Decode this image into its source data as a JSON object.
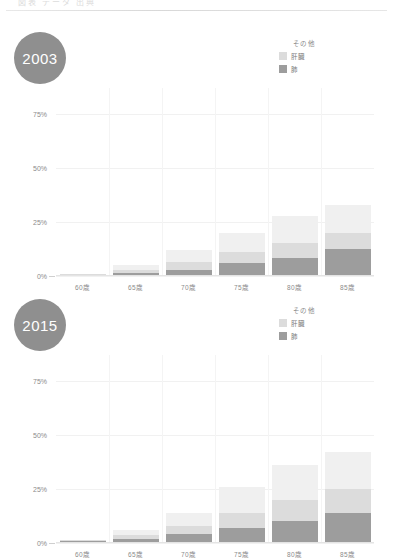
{
  "page": {
    "header_ghost": "図表  データ  出典",
    "background": "#ffffff"
  },
  "colors": {
    "series_lung": "#9d9d9d",
    "series_liver": "#dcdcdc",
    "series_other": "#f0f0f0",
    "badge": "#8f8f8f",
    "badge_text": "#ffffff",
    "axis_text": "#8b8b8b",
    "gridline": "#f1f1f1"
  },
  "charts": [
    {
      "id": "chart-2003",
      "year_badge": "2003",
      "legend": {
        "title": "その他",
        "items": [
          {
            "label": "肝臓",
            "color": "#dcdcdc"
          },
          {
            "label": "肺",
            "color": "#9d9d9d"
          }
        ]
      },
      "yticks": [
        "0%",
        "25%",
        "50%",
        "75%"
      ],
      "xlabels": [
        "60歳",
        "65歳",
        "70歳",
        "75歳",
        "80歳",
        "85歳"
      ]
    },
    {
      "id": "chart-2015",
      "year_badge": "2015",
      "legend": {
        "title": "その他",
        "items": [
          {
            "label": "肝臓",
            "color": "#dcdcdc"
          },
          {
            "label": "肺",
            "color": "#9d9d9d"
          }
        ]
      },
      "yticks": [
        "0%",
        "25%",
        "50%",
        "75%"
      ],
      "xlabels": [
        "60歳",
        "65歳",
        "70歳",
        "75歳",
        "80歳",
        "85歳"
      ]
    }
  ],
  "chart_data": [
    {
      "type": "bar",
      "stacked": true,
      "title": "2003",
      "xlabel": "",
      "ylabel": "",
      "ylim": [
        0,
        87
      ],
      "yticks": [
        0,
        25,
        50,
        75
      ],
      "ytick_labels": [
        "0%",
        "25%",
        "50%",
        "75%"
      ],
      "grid": true,
      "legend_position": "top-right",
      "categories": [
        "60歳",
        "65歳",
        "70歳",
        "75歳",
        "80歳",
        "85歳"
      ],
      "series": [
        {
          "name": "肺",
          "color": "#9d9d9d",
          "values": [
            0.5,
            1.5,
            3.0,
            6.0,
            8.5,
            12.5
          ]
        },
        {
          "name": "肝臓",
          "color": "#dcdcdc",
          "values": [
            0.3,
            1.5,
            3.5,
            5.0,
            7.0,
            7.5
          ]
        },
        {
          "name": "その他",
          "color": "#f0f0f0",
          "values": [
            0.2,
            2.0,
            5.5,
            9.0,
            12.5,
            13.0
          ]
        }
      ],
      "totals": [
        1.0,
        5.0,
        12.0,
        20.0,
        28.0,
        33.0
      ]
    },
    {
      "type": "bar",
      "stacked": true,
      "title": "2015",
      "xlabel": "",
      "ylabel": "",
      "ylim": [
        0,
        87
      ],
      "yticks": [
        0,
        25,
        50,
        75
      ],
      "ytick_labels": [
        "0%",
        "25%",
        "50%",
        "75%"
      ],
      "grid": true,
      "legend_position": "top-right",
      "categories": [
        "60歳",
        "65歳",
        "70歳",
        "75歳",
        "80歳",
        "85歳"
      ],
      "series": [
        {
          "name": "肺",
          "color": "#9d9d9d",
          "values": [
            0.8,
            2.0,
            4.0,
            7.0,
            10.0,
            14.0
          ]
        },
        {
          "name": "肝臓",
          "color": "#dcdcdc",
          "values": [
            0.4,
            1.8,
            4.0,
            7.0,
            10.0,
            11.0
          ]
        },
        {
          "name": "その他",
          "color": "#f0f0f0",
          "values": [
            0.3,
            2.2,
            6.0,
            12.0,
            16.0,
            17.0
          ]
        }
      ],
      "totals": [
        1.5,
        6.0,
        14.0,
        26.0,
        36.0,
        42.0
      ]
    }
  ]
}
